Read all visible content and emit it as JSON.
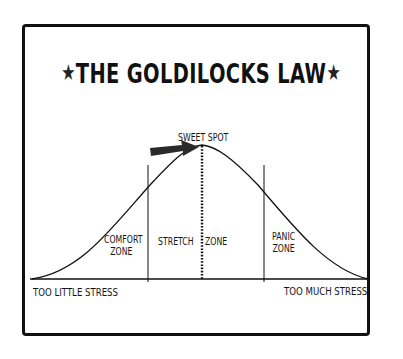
{
  "header": {
    "faded_text": "TOPICS · STRESS · MOTIVATION"
  },
  "title": {
    "text": "THE GOLDILOCKS LAW",
    "left_decoration": "star-icon",
    "right_decoration": "star-icon",
    "star_glyph": "★"
  },
  "diagram": {
    "peak_label": "SWEET SPOT",
    "zones": [
      {
        "line1": "COMFORT",
        "line2": "ZONE"
      },
      {
        "line1": "STRETCH",
        "line2": ""
      },
      {
        "line1": "ZONE",
        "line2": ""
      },
      {
        "line1": "PANIC",
        "line2": "ZONE"
      }
    ],
    "axis_left_label": "TOO LITTLE STRESS",
    "axis_right_label": "TOO MUCH STRESS",
    "colors": {
      "ink": "#111111",
      "arrow": "#2a2a2a",
      "background": "#ffffff"
    }
  }
}
